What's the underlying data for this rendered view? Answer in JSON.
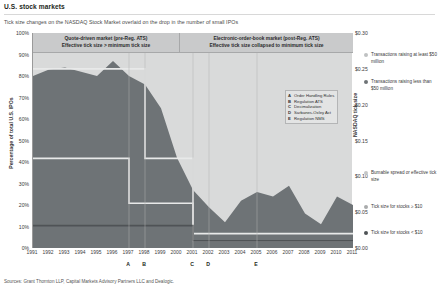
{
  "page": {
    "title": "U.S. stock markets",
    "subtitle": "Tick size changes on the NASDAQ Stock Market overlaid on the drop in the number of small IPOs",
    "sources": "Sources: Grant Thornton LLP, Capital Markets Advisory Partners LLC and Dealogic."
  },
  "banners": {
    "left_line1": "Quote-driven market (pre-Reg. ATS)",
    "left_line2": "Effective tick size > minimum tick size",
    "right_line1": "Electronic-order-book market (post-Reg. ATS)",
    "right_line2": "Effective tick size collapsed to minimum tick size"
  },
  "event_legend": [
    {
      "key": "A",
      "label": "Order Handling Rules"
    },
    {
      "key": "B",
      "label": "Regulation ATS"
    },
    {
      "key": "C",
      "label": "Decimalization"
    },
    {
      "key": "D",
      "label": "Sarbanes-Oxley Act"
    },
    {
      "key": "E",
      "label": "Regulation NMS"
    }
  ],
  "right_legend": [
    {
      "label": "Transactions raising at least $50 million",
      "color": "#bfc1c2",
      "top": 0
    },
    {
      "label": "Transactions raising less than $50 million",
      "color": "#6e7376",
      "top": 27
    },
    {
      "label": "Bumable spread or effective tick size",
      "color": "#c4c6c7",
      "top": 118
    },
    {
      "label": "Tick size for stocks ≥ $10",
      "color": "#a9abac",
      "top": 152
    },
    {
      "label": "Tick size for stocks < $10",
      "color": "#4f5356",
      "top": 178
    }
  ],
  "colors": {
    "plot_background": "#d9dada",
    "banner_background": "#c9cacb",
    "small_ipo_area": "#6e7376",
    "large_ipo_area": "#d9dada",
    "tick_line_ge10": "#e8e9e9",
    "tick_line_lt10": "#4f5356",
    "axis": "#9a9a9a"
  },
  "chart_data": {
    "type": "area",
    "title": "Tick size changes on the NASDAQ Stock Market overlaid on the drop in the number of small IPOs",
    "xlabel": "",
    "ylabel": "Percentage of total U.S. IPOs",
    "y2label": "NASDAQ tick size",
    "ylim": [
      0,
      100
    ],
    "y2lim": [
      0.0,
      0.3
    ],
    "grid": false,
    "legend_position": "right",
    "x": [
      1991,
      1992,
      1993,
      1994,
      1995,
      1996,
      1997,
      1998,
      1999,
      2000,
      2001,
      2002,
      2003,
      2004,
      2005,
      2006,
      2007,
      2008,
      2009,
      2010,
      2011
    ],
    "xticklabels": [
      "1991",
      "1992",
      "1993",
      "1994",
      "1995",
      "1996",
      "1997",
      "1998",
      "1999",
      "2000",
      "2001",
      "2002",
      "2003",
      "2004",
      "2005",
      "2006",
      "2007",
      "2008",
      "2009",
      "2010",
      "2011"
    ],
    "yticklabels": [
      "0%",
      "10%",
      "20%",
      "30%",
      "40%",
      "50%",
      "60%",
      "70%",
      "80%",
      "90%",
      "100%"
    ],
    "y2ticklabels": [
      "$0.00",
      "$0.05",
      "$0.10",
      "$0.15",
      "$0.20",
      "$0.25",
      "$0.30"
    ],
    "series": [
      {
        "name": "Transactions raising less than $50 million",
        "axis": "left",
        "unit": "percent",
        "values": [
          80,
          83,
          84,
          82,
          80,
          87,
          80,
          76,
          65,
          42,
          27,
          19,
          12,
          22,
          26,
          24,
          29,
          16,
          11,
          24,
          20
        ]
      },
      {
        "name": "Transactions raising at least $50 million",
        "axis": "left",
        "unit": "percent",
        "values": [
          20,
          17,
          16,
          18,
          20,
          13,
          20,
          24,
          35,
          58,
          73,
          81,
          88,
          78,
          74,
          76,
          71,
          84,
          89,
          76,
          80
        ]
      },
      {
        "name": "Tick size for stocks ≥ $10",
        "axis": "right",
        "unit": "dollars",
        "values": [
          0.125,
          0.125,
          0.125,
          0.125,
          0.125,
          0.125,
          0.0625,
          0.0625,
          0.0625,
          0.0625,
          0.01,
          0.01,
          0.01,
          0.01,
          0.01,
          0.01,
          0.01,
          0.01,
          0.01,
          0.01,
          0.01
        ]
      },
      {
        "name": "Tick size for stocks < $10",
        "axis": "right",
        "unit": "dollars",
        "values": [
          0.03125,
          0.03125,
          0.03125,
          0.03125,
          0.03125,
          0.03125,
          0.03125,
          0.03125,
          0.03125,
          0.03125,
          0.01,
          0.01,
          0.01,
          0.01,
          0.01,
          0.01,
          0.01,
          0.01,
          0.01,
          0.01,
          0.01
        ]
      },
      {
        "name": "Bumable spread or effective tick size",
        "axis": "right",
        "unit": "dollars",
        "values": [
          0.25,
          0.25,
          0.25,
          0.25,
          0.25,
          0.25,
          0.25,
          0.125,
          0.125,
          0.125,
          0.02,
          0.02,
          0.02,
          0.02,
          0.02,
          0.02,
          0.02,
          0.02,
          0.02,
          0.02,
          0.02
        ]
      }
    ],
    "annotations": [
      {
        "key": "A",
        "label": "Order Handling Rules",
        "x": 1997
      },
      {
        "key": "B",
        "label": "Regulation ATS",
        "x": 1998
      },
      {
        "key": "C",
        "label": "Decimalization",
        "x": 2001
      },
      {
        "key": "D",
        "label": "Sarbanes-Oxley Act",
        "x": 2002
      },
      {
        "key": "E",
        "label": "Regulation NMS",
        "x": 2005
      }
    ]
  }
}
